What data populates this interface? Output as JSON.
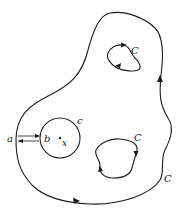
{
  "diagram": {
    "type": "contour-integration-region",
    "labels": {
      "outer_contour": "C",
      "upper_hole": "C",
      "lower_hole": "C",
      "circle": "c",
      "point_a": "a",
      "point_b": "b",
      "point_x": "x"
    },
    "elements": [
      {
        "id": "outer-contour",
        "description": "Outer closed curve, counter-clockwise orientation"
      },
      {
        "id": "upper-hole-contour",
        "description": "Small inner curve, clockwise orientation"
      },
      {
        "id": "lower-hole-contour",
        "description": "Inner curve, clockwise orientation"
      },
      {
        "id": "small-circle",
        "description": "Circle c around point x"
      },
      {
        "id": "cut-lines",
        "description": "Pair of parallel lines from a to b with opposite arrows"
      }
    ],
    "colors": {
      "ink": "#1a1a1a",
      "background": "#ffffff"
    }
  }
}
